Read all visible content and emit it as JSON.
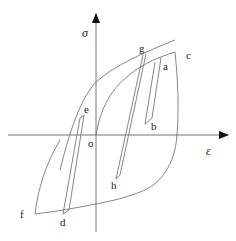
{
  "diagram": {
    "axes": {
      "y_label": "σ",
      "x_label": "ε",
      "origin_label": "o"
    },
    "points": {
      "a": "a",
      "b": "b",
      "c": "c",
      "d": "d",
      "e": "e",
      "f": "f",
      "g": "g",
      "h": "h"
    },
    "colors": {
      "line": "#777777",
      "axis": "#666666",
      "text": "#222222"
    }
  }
}
